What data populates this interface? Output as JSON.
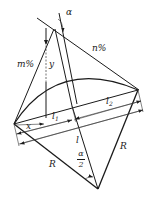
{
  "diagram": {
    "type": "geometric-arc-diagram",
    "labels": {
      "alpha": "α",
      "n_percent": "n%",
      "m_percent": "m%",
      "y": "y",
      "x": "x",
      "l1_base": "l",
      "l1_sub": "1",
      "l2_base": "l",
      "l2_sub": "2",
      "l": "l",
      "R_left": "R",
      "R_right": "R",
      "half_alpha_num": "α",
      "half_alpha_den": "2"
    },
    "colors": {
      "stroke": "#1a1a1a",
      "background": "#ffffff"
    }
  }
}
